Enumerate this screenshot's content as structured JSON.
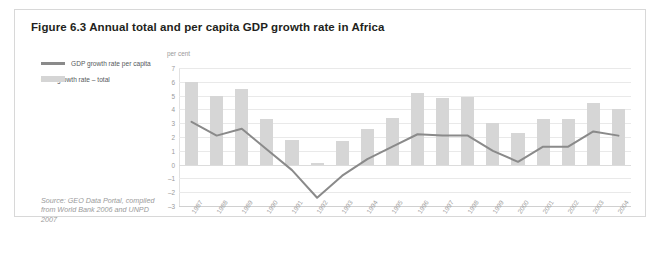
{
  "figure": {
    "title": "Figure 6.3 Annual total and per capita GDP growth rate in Africa",
    "source": "Source: GEO Data Portal, compiled from World Bank 2006 and UNPD 2007"
  },
  "legend": {
    "items": [
      {
        "label": "GDP growth rate per capita",
        "marker": "line",
        "color": "#8a8a8a"
      },
      {
        "label": "GDP growth rate – total",
        "marker": "bar",
        "color": "#d5d5d5"
      }
    ]
  },
  "colors": {
    "bar": "#d6d6d6",
    "line": "#8a8a8a",
    "grid": "#e9e9e9",
    "border": "#d8d8d8",
    "title_text": "#231f20",
    "axis_text": "#9a9a9a",
    "source_text": "#9a9a9a"
  },
  "chart_data": {
    "type": "bar",
    "title": "Figure 6.3 Annual total and per capita GDP growth rate in Africa",
    "xlabel": "",
    "ylabel": "per cent",
    "ylim": [
      -3,
      7
    ],
    "yticks": [
      7,
      6,
      5,
      4,
      3,
      2,
      1,
      0,
      -1,
      -2,
      -3
    ],
    "ytick_labels": [
      "7",
      "6",
      "5",
      "4",
      "3",
      "2",
      "1",
      "0",
      "–1",
      "–2",
      "–3"
    ],
    "grid": true,
    "legend_position": "top-left-outside",
    "categories": [
      "1987",
      "1988",
      "1989",
      "1990",
      "1991",
      "1992",
      "1993",
      "1994",
      "1995",
      "1996",
      "1997",
      "1998",
      "1999",
      "2000",
      "2001",
      "2002",
      "2003",
      "2004"
    ],
    "series": [
      {
        "name": "GDP growth rate – total",
        "type": "bar",
        "color": "#d6d6d6",
        "values": [
          6.0,
          5.0,
          5.5,
          3.3,
          1.8,
          0.1,
          1.7,
          2.6,
          3.4,
          5.2,
          4.8,
          4.9,
          3.0,
          2.3,
          3.3,
          3.3,
          4.5,
          4.0
        ]
      },
      {
        "name": "GDP growth rate per capita",
        "type": "line",
        "color": "#8a8a8a",
        "values": [
          3.1,
          2.1,
          2.6,
          1.1,
          -0.4,
          -2.4,
          -0.8,
          0.4,
          1.3,
          2.2,
          2.1,
          2.1,
          1.0,
          0.2,
          1.3,
          1.3,
          2.4,
          2.1
        ]
      }
    ]
  }
}
